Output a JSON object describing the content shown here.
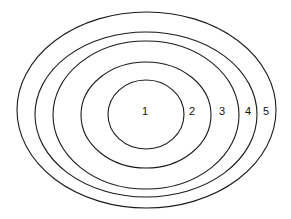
{
  "diagram": {
    "type": "nested-ellipses",
    "stroke_color": "#1a1a1a",
    "background": "#ffffff",
    "rings": [
      {
        "label": "1",
        "cx": 146,
        "cy": 114.5,
        "rx": 38,
        "ry": 34.5,
        "label_x": 145,
        "label_y": 112
      },
      {
        "label": "2",
        "cx": 146,
        "cy": 115,
        "rx": 65,
        "ry": 53,
        "label_x": 192,
        "label_y": 112
      },
      {
        "label": "3",
        "cx": 146,
        "cy": 115,
        "rx": 93,
        "ry": 74,
        "label_x": 222,
        "label_y": 112
      },
      {
        "label": "4",
        "cx": 146,
        "cy": 114.5,
        "rx": 111,
        "ry": 82.5,
        "label_x": 248,
        "label_y": 112
      },
      {
        "label": "5",
        "cx": 146.5,
        "cy": 110,
        "rx": 129.5,
        "ry": 98,
        "label_x": 266,
        "label_y": 112
      }
    ]
  }
}
